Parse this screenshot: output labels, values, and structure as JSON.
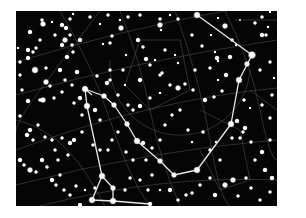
{
  "image": {
    "subject": "Star chart with constellation outline",
    "background_color": "#ffffff",
    "sky_color": "#050505",
    "sky_rect": {
      "x": 16,
      "y": 11,
      "w": 261,
      "h": 195
    },
    "line_color": "#e8e8e8",
    "grid_color": "#6a6a6a",
    "star_color": "#ffffff"
  },
  "constellation": {
    "main_path": [
      [
        197,
        15
      ],
      [
        252,
        55
      ],
      [
        239,
        80
      ],
      [
        231,
        124
      ],
      [
        197,
        170
      ],
      [
        174,
        175
      ],
      [
        160,
        161
      ],
      [
        137,
        141
      ],
      [
        127,
        124
      ],
      [
        114,
        105
      ],
      [
        104,
        96
      ],
      [
        85,
        89
      ]
    ],
    "branch_path": [
      [
        85,
        89
      ],
      [
        87,
        106
      ],
      [
        102,
        176
      ],
      [
        92,
        200
      ],
      [
        113,
        201
      ],
      [
        150,
        204
      ]
    ],
    "extra_segments": [
      [
        [
          102,
          176
        ],
        [
          113,
          188
        ]
      ],
      [
        [
          113,
          188
        ],
        [
          113,
          201
        ]
      ],
      [
        [
          85,
          89
        ],
        [
          92,
          95
        ]
      ]
    ],
    "node_stars": [
      [
        197,
        15,
        3.5
      ],
      [
        252,
        55,
        4
      ],
      [
        239,
        80,
        3.5
      ],
      [
        231,
        124,
        3.5
      ],
      [
        237,
        121,
        2.5
      ],
      [
        197,
        170,
        3.5
      ],
      [
        174,
        175,
        3
      ],
      [
        160,
        161,
        3
      ],
      [
        143,
        143,
        2.5
      ],
      [
        137,
        141,
        3.5
      ],
      [
        127,
        124,
        3
      ],
      [
        114,
        105,
        3
      ],
      [
        104,
        96,
        3
      ],
      [
        85,
        89,
        3.5
      ],
      [
        87,
        106,
        3.5
      ],
      [
        102,
        176,
        3.5
      ],
      [
        113,
        188,
        3
      ],
      [
        92,
        200,
        3.5
      ],
      [
        113,
        201,
        3.5
      ],
      [
        150,
        204,
        2.5
      ]
    ]
  },
  "grid_lines": [
    "M16,62 Q120,30 230,10",
    "M16,95 Q140,60 277,40",
    "M16,150 Q150,100 277,88",
    "M16,185 Q150,150 277,140",
    "M40,206 Q160,175 277,180",
    "M60,11 Q90,60 110,120 T150,206",
    "M120,11 Q140,60 150,110 T180,206",
    "M175,11 Q200,80 210,140 T230,206",
    "M225,11 Q250,60 260,110 T277,160",
    "M16,120 Q60,130 90,180 T100,206",
    "M100,11 Q70,50 40,90 T16,140",
    "M110,60 A70,70 0 0 0 250,70",
    "M140,40 L180,40 L190,90 L150,110 L125,85 Z",
    "M200,110 L240,130 L250,180 L220,190 L200,150",
    "M235,20 L277,20",
    "M250,90 L277,110"
  ],
  "background_stars": [
    [
      42,
      20,
      2
    ],
    [
      52,
      22,
      1.5
    ],
    [
      62,
      25,
      2.5
    ],
    [
      90,
      17,
      2
    ],
    [
      108,
      15,
      2
    ],
    [
      120,
      20,
      1.5
    ],
    [
      128,
      17,
      2
    ],
    [
      140,
      15,
      2
    ],
    [
      160,
      19,
      2
    ],
    [
      170,
      15,
      1.5
    ],
    [
      178,
      19,
      2
    ],
    [
      218,
      18,
      1.5
    ],
    [
      240,
      20,
      1
    ],
    [
      262,
      17,
      2
    ],
    [
      270,
      12,
      1.5
    ],
    [
      43,
      24,
      3
    ],
    [
      30,
      32,
      2.5
    ],
    [
      18,
      48,
      1.5
    ],
    [
      28,
      50,
      2.5
    ],
    [
      33,
      52,
      2
    ],
    [
      36,
      48,
      2
    ],
    [
      40,
      40,
      2
    ],
    [
      55,
      35,
      2
    ],
    [
      66,
      28,
      2.5
    ],
    [
      70,
      19,
      2
    ],
    [
      73,
      14,
      1.5
    ],
    [
      100,
      24,
      1.5
    ],
    [
      121,
      28,
      3
    ],
    [
      138,
      40,
      2.5
    ],
    [
      160,
      25,
      3
    ],
    [
      161,
      30,
      1.5
    ],
    [
      225,
      26,
      3
    ],
    [
      255,
      23,
      2
    ],
    [
      262,
      35,
      2.5
    ],
    [
      266,
      35,
      2
    ],
    [
      268,
      27,
      1.5
    ],
    [
      28,
      58,
      2.5
    ],
    [
      20,
      62,
      2
    ],
    [
      35,
      70,
      3.5
    ],
    [
      46,
      68,
      2
    ],
    [
      62,
      45,
      2.5
    ],
    [
      65,
      40,
      3
    ],
    [
      70,
      35,
      2
    ],
    [
      72,
      45,
      2
    ],
    [
      73,
      52,
      2
    ],
    [
      67,
      57,
      2.5
    ],
    [
      80,
      40,
      2.5
    ],
    [
      103,
      44,
      1.5
    ],
    [
      112,
      36,
      2
    ],
    [
      110,
      43,
      2
    ],
    [
      126,
      55,
      1.5
    ],
    [
      143,
      47,
      2
    ],
    [
      146,
      59,
      2.5
    ],
    [
      165,
      50,
      2
    ],
    [
      175,
      55,
      1.5
    ],
    [
      192,
      35,
      2
    ],
    [
      202,
      46,
      2
    ],
    [
      211,
      35,
      1.5
    ],
    [
      217,
      58,
      2.5
    ],
    [
      218,
      61,
      1.5
    ],
    [
      236,
      45,
      1.5
    ],
    [
      20,
      75,
      2
    ],
    [
      46,
      82,
      3
    ],
    [
      50,
      86,
      2
    ],
    [
      60,
      70,
      2.5
    ],
    [
      65,
      80,
      2
    ],
    [
      72,
      85,
      2
    ],
    [
      77,
      72,
      2.5
    ],
    [
      97,
      76,
      2
    ],
    [
      107,
      83,
      2.5
    ],
    [
      110,
      70,
      2
    ],
    [
      123,
      70,
      2
    ],
    [
      125,
      85,
      1.5
    ],
    [
      140,
      80,
      2.5
    ],
    [
      150,
      65,
      2
    ],
    [
      155,
      60,
      1.5
    ],
    [
      160,
      75,
      2
    ],
    [
      162,
      73,
      2
    ],
    [
      178,
      63,
      1.5
    ],
    [
      195,
      70,
      2
    ],
    [
      210,
      68,
      2
    ],
    [
      215,
      52,
      1.5
    ],
    [
      226,
      75,
      2.5
    ],
    [
      230,
      57,
      2.5
    ],
    [
      232,
      40,
      2
    ],
    [
      247,
      64,
      3
    ],
    [
      260,
      70,
      2
    ],
    [
      270,
      62,
      2
    ],
    [
      274,
      78,
      1.5
    ],
    [
      22,
      90,
      2
    ],
    [
      28,
      101,
      2.5
    ],
    [
      40,
      100,
      2
    ],
    [
      43,
      100,
      3
    ],
    [
      54,
      98,
      2
    ],
    [
      62,
      92,
      2
    ],
    [
      74,
      103,
      2
    ],
    [
      80,
      98,
      2.5
    ],
    [
      82,
      115,
      2
    ],
    [
      95,
      110,
      2.5
    ],
    [
      100,
      120,
      2
    ],
    [
      110,
      80,
      2
    ],
    [
      118,
      95,
      2
    ],
    [
      128,
      105,
      2
    ],
    [
      133,
      110,
      2
    ],
    [
      140,
      106,
      2.5
    ],
    [
      150,
      98,
      2
    ],
    [
      160,
      93,
      1.5
    ],
    [
      170,
      85,
      2
    ],
    [
      178,
      88,
      3
    ],
    [
      185,
      84,
      2
    ],
    [
      193,
      90,
      2
    ],
    [
      205,
      100,
      2.5
    ],
    [
      214,
      97,
      2
    ],
    [
      218,
      80,
      1.5
    ],
    [
      222,
      91,
      2
    ],
    [
      244,
      100,
      2
    ],
    [
      250,
      108,
      1.5
    ],
    [
      262,
      105,
      2
    ],
    [
      270,
      118,
      2
    ],
    [
      272,
      95,
      2
    ],
    [
      20,
      116,
      2
    ],
    [
      27,
      135,
      2.5
    ],
    [
      30,
      130,
      2.5
    ],
    [
      33,
      140,
      2
    ],
    [
      38,
      125,
      2
    ],
    [
      45,
      137,
      2
    ],
    [
      52,
      140,
      2
    ],
    [
      55,
      150,
      2
    ],
    [
      58,
      160,
      2
    ],
    [
      62,
      138,
      2
    ],
    [
      68,
      155,
      2
    ],
    [
      70,
      143,
      2.5
    ],
    [
      74,
      140,
      2.5
    ],
    [
      82,
      132,
      2
    ],
    [
      93,
      145,
      2
    ],
    [
      100,
      150,
      2
    ],
    [
      108,
      150,
      2
    ],
    [
      112,
      140,
      2
    ],
    [
      118,
      132,
      2
    ],
    [
      126,
      152,
      2
    ],
    [
      133,
      160,
      2
    ],
    [
      146,
      160,
      2
    ],
    [
      152,
      148,
      2
    ],
    [
      160,
      140,
      2
    ],
    [
      165,
      125,
      2
    ],
    [
      172,
      115,
      2
    ],
    [
      180,
      110,
      2
    ],
    [
      188,
      130,
      2
    ],
    [
      192,
      142,
      1.5
    ],
    [
      203,
      132,
      2
    ],
    [
      210,
      150,
      2
    ],
    [
      216,
      142,
      1.5
    ],
    [
      220,
      160,
      2
    ],
    [
      232,
      138,
      2
    ],
    [
      240,
      138,
      2
    ],
    [
      243,
      132,
      2
    ],
    [
      245,
      128,
      2.5
    ],
    [
      251,
      142,
      2
    ],
    [
      255,
      160,
      2
    ],
    [
      262,
      152,
      2.5
    ],
    [
      265,
      170,
      2.5
    ],
    [
      270,
      140,
      2
    ],
    [
      20,
      160,
      2.5
    ],
    [
      24,
      165,
      2
    ],
    [
      30,
      170,
      3
    ],
    [
      36,
      172,
      2
    ],
    [
      42,
      160,
      2.5
    ],
    [
      47,
      167,
      2
    ],
    [
      52,
      180,
      2.5
    ],
    [
      56,
      185,
      2
    ],
    [
      60,
      175,
      2
    ],
    [
      64,
      190,
      2
    ],
    [
      70,
      195,
      2
    ],
    [
      76,
      186,
      2
    ],
    [
      80,
      205,
      2.5
    ],
    [
      85,
      190,
      1.5
    ],
    [
      95,
      188,
      2
    ],
    [
      125,
      190,
      2
    ],
    [
      130,
      178,
      2
    ],
    [
      140,
      180,
      2
    ],
    [
      148,
      190,
      2
    ],
    [
      152,
      175,
      2
    ],
    [
      160,
      190,
      1.5
    ],
    [
      170,
      190,
      2.5
    ],
    [
      178,
      200,
      2
    ],
    [
      186,
      195,
      2
    ],
    [
      192,
      193,
      2
    ],
    [
      200,
      185,
      2
    ],
    [
      210,
      178,
      2
    ],
    [
      215,
      195,
      2.5
    ],
    [
      225,
      185,
      3
    ],
    [
      233,
      180,
      3
    ],
    [
      238,
      196,
      2
    ],
    [
      246,
      178,
      2
    ],
    [
      251,
      188,
      2
    ],
    [
      260,
      200,
      2
    ],
    [
      270,
      192,
      2
    ],
    [
      272,
      178,
      2.5
    ]
  ]
}
